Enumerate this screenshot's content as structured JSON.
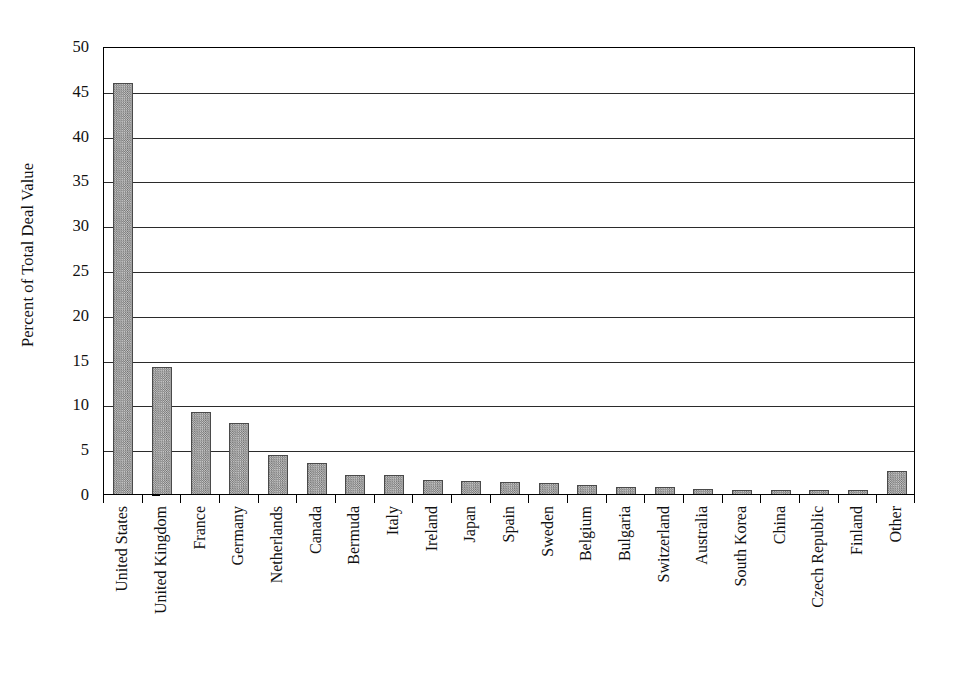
{
  "chart_data": {
    "type": "bar",
    "title": "",
    "subtitle": "",
    "xlabel": "",
    "ylabel": "Percent of Total Deal Value",
    "ylim": [
      0,
      50
    ],
    "yticks": [
      0,
      5,
      10,
      15,
      20,
      25,
      30,
      35,
      40,
      45,
      50
    ],
    "ytick_labels": [
      "0",
      "5",
      "10",
      "15",
      "20",
      "25",
      "30",
      "35",
      "40",
      "45",
      "50"
    ],
    "grid": true,
    "grid_axis": "y",
    "legend": null,
    "legend_position": "none",
    "bar_color": "#8a8a8a",
    "bar_edge_color": "#4a4a4a",
    "axis_color": "#000000",
    "background_color": "#ffffff",
    "categories": [
      "United States",
      "United Kingdom",
      "France",
      "Germany",
      "Netherlands",
      "Canada",
      "Bermuda",
      "Italy",
      "Ireland",
      "Japan",
      "Spain",
      "Sweden",
      "Belgium",
      "Bulgaria",
      "Switzerland",
      "Australia",
      "South Korea",
      "China",
      "Czech Republic",
      "Finland",
      "Other"
    ],
    "values": [
      45.9,
      14.2,
      9.1,
      7.9,
      4.4,
      3.5,
      2.1,
      2.1,
      1.6,
      1.5,
      1.3,
      1.2,
      1.0,
      0.8,
      0.8,
      0.6,
      0.5,
      0.4,
      0.4,
      0.4,
      2.6
    ]
  }
}
